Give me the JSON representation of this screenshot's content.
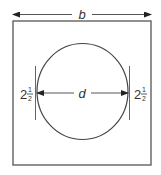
{
  "diagram": {
    "labels": {
      "width": "b",
      "diameter": "d",
      "left_margin_whole": "2",
      "left_margin_num": "1",
      "left_margin_den": "2",
      "right_margin_whole": "2",
      "right_margin_num": "1",
      "right_margin_den": "2"
    },
    "colors": {
      "stroke": "#444444",
      "text": "#333333",
      "background": "#ffffff"
    }
  }
}
